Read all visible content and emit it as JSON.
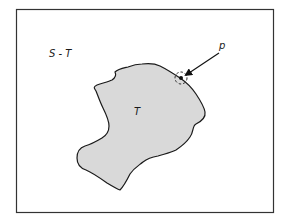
{
  "diagram": {
    "frame": {
      "x": 16,
      "y": 9,
      "width": 257,
      "height": 203,
      "stroke": "#333333"
    },
    "labels": {
      "outer_region": "S - T",
      "inner_region": "T",
      "point": "p"
    },
    "region_T": {
      "fill": "#d9d9d9",
      "stroke": "#1a1a1a"
    },
    "point_p": {
      "x": 181,
      "y": 78,
      "arrow_from": [
        220,
        52
      ],
      "neighborhood": "dashed circle around p"
    }
  }
}
